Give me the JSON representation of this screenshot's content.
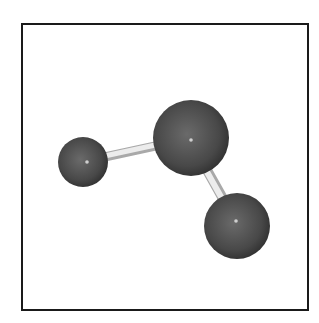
{
  "figure": {
    "type": "ball-and-stick molecular model",
    "atoms": [
      {
        "id": "left",
        "cx": 87,
        "cy": 162,
        "r": 25
      },
      {
        "id": "center",
        "cx": 191,
        "cy": 138,
        "r": 38
      },
      {
        "id": "right",
        "cx": 237,
        "cy": 226,
        "r": 33
      }
    ],
    "bonds": [
      {
        "from": "left",
        "to": "center"
      },
      {
        "from": "center",
        "to": "right"
      }
    ],
    "colors": {
      "atom": "#4a4a4a",
      "bond": "#e0e0e0",
      "frame": "#1a1a1a"
    }
  }
}
